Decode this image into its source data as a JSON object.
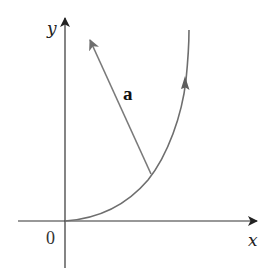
{
  "figure": {
    "colors": {
      "axes": "#333333",
      "curve": "#6e6e6e",
      "vector": "#7a7a7a",
      "background": "#ffffff"
    },
    "axes": {
      "x_label": "x",
      "y_label": "y",
      "origin_label": "0"
    },
    "vector": {
      "label": "a"
    }
  }
}
